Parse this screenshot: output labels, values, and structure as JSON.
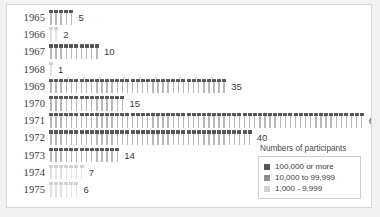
{
  "chart_data": {
    "type": "bar",
    "title": "",
    "subtitle": "",
    "xlabel": "",
    "ylabel": "",
    "grid": false,
    "orientation": "horizontal",
    "unit_note": "each icon represents one unit",
    "categories": [
      "1965",
      "1966",
      "1967",
      "1968",
      "1969",
      "1970",
      "1971",
      "1972",
      "1973",
      "1974",
      "1975"
    ],
    "values": [
      5,
      2,
      10,
      1,
      35,
      15,
      62,
      40,
      14,
      7,
      6
    ],
    "value_labels": [
      "5",
      "2",
      "10",
      "1",
      "35",
      "15",
      "62",
      "40",
      "14",
      "7",
      "6"
    ],
    "tiers": [
      "dark",
      "light",
      "dark",
      "light",
      "dark",
      "dark",
      "dark",
      "dark",
      "dark",
      "light",
      "light"
    ],
    "xlim": [
      0,
      62
    ],
    "legend_position": "bottom-right",
    "legend": {
      "title": "Numbers of participants",
      "entries": [
        {
          "label": "100,000 or more",
          "color": "#565656",
          "key": "dark"
        },
        {
          "label": "10,000 to 99,999",
          "color": "#8f8f8f",
          "key": "mid"
        },
        {
          "label": "1,000 - 9,999",
          "color": "#d2d2d2",
          "key": "light"
        }
      ]
    }
  },
  "colors": {
    "page_background": "#f2f2f2",
    "plot_background": "#ffffff",
    "frame_border": "#d7d7d7",
    "text": "#3c3c3c",
    "icon_dark": "#565656",
    "icon_mid": "#8f8f8f",
    "icon_light": "#d2d2d2",
    "stem_dark": "#b9b9b9",
    "stem_light": "#e2e2e2"
  }
}
